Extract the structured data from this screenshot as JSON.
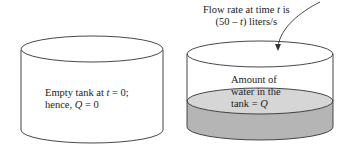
{
  "left_tank": {
    "line1_prefix": "Empty tank at ",
    "line1_var": "t",
    "line1_suffix": " = 0;",
    "line2_prefix": "hence, ",
    "line2_var": "Q",
    "line2_suffix": " = 0"
  },
  "right_tank": {
    "flow_line1_prefix": "Flow rate at time ",
    "flow_line1_var": "t",
    "flow_line1_suffix": " is",
    "flow_line2_prefix": "(50 – ",
    "flow_line2_var": "t",
    "flow_line2_suffix": ") liters/s",
    "water_line1": "Amount of",
    "water_line2": "water in the",
    "water_line3_prefix": "tank = ",
    "water_line3_var": "Q"
  },
  "colors": {
    "outline": "#333333",
    "water_side": "#b5b5b5",
    "water_top": "#d6d6d6"
  }
}
